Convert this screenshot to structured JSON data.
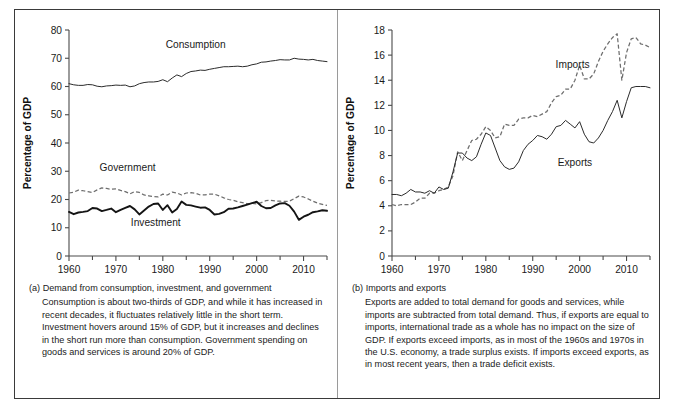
{
  "figure": {
    "panel_a_letter": "(a)",
    "panel_b_letter": "(b)"
  },
  "panel_a": {
    "caption_title": "(a) Demand from consumption, investment, and government",
    "caption_body": "Consumption is about two-thirds of GDP, and while it has increased in recent decades, it fluctuates relatively little in the short term. Investment hovers around 15% of GDP, but it increases and declines in the short run more than consumption. Government spending on goods and services is around 20% of GDP."
  },
  "panel_b": {
    "caption_title": "(b) Imports and exports",
    "caption_body": "Exports are added to total demand for goods and services, while imports are subtracted from total demand. Thus, if exports are equal to imports, international trade as a whole has no impact on the size of GDP. If exports exceed imports, as in most of the 1960s and 1970s in the U.S. economy, a trade surplus exists. If imports exceed exports, as in most recent years, then a trade deficit exists."
  },
  "chart_data": [
    {
      "id": "chart-a",
      "type": "line",
      "title": "",
      "xlabel": "Year",
      "ylabel": "Percentage of GDP",
      "xlim": [
        1960,
        2015
      ],
      "ylim": [
        0,
        80
      ],
      "xticks": [
        1960,
        1970,
        1980,
        1990,
        2000,
        2010
      ],
      "yticks": [
        0,
        10,
        20,
        30,
        40,
        50,
        60,
        70,
        80
      ],
      "grid": false,
      "legend_position": "inline-annotations",
      "annotations": [
        {
          "text": "Consumption",
          "x": 1987,
          "y": 73.5
        },
        {
          "text": "Government",
          "x": 1972.5,
          "y": 30.0
        },
        {
          "text": "Investment",
          "x": 1978.5,
          "y": 10.5
        }
      ],
      "x": [
        1960,
        1961,
        1962,
        1963,
        1964,
        1965,
        1966,
        1967,
        1968,
        1969,
        1970,
        1971,
        1972,
        1973,
        1974,
        1975,
        1976,
        1977,
        1978,
        1979,
        1980,
        1981,
        1982,
        1983,
        1984,
        1985,
        1986,
        1987,
        1988,
        1989,
        1990,
        1991,
        1992,
        1993,
        1994,
        1995,
        1996,
        1997,
        1998,
        1999,
        2000,
        2001,
        2002,
        2003,
        2004,
        2005,
        2006,
        2007,
        2008,
        2009,
        2010,
        2011,
        2012,
        2013,
        2014,
        2015
      ],
      "series": [
        {
          "name": "Consumption",
          "style": "solid-thin",
          "values": [
            61.0,
            60.6,
            60.4,
            60.4,
            60.7,
            60.6,
            60.1,
            59.9,
            60.2,
            60.3,
            60.5,
            60.4,
            60.5,
            59.9,
            60.2,
            61.0,
            61.4,
            61.6,
            61.6,
            61.8,
            62.4,
            61.7,
            63.0,
            64.1,
            63.5,
            64.6,
            65.3,
            65.5,
            65.8,
            65.7,
            66.1,
            66.4,
            66.7,
            67.0,
            67.0,
            67.1,
            67.2,
            67.0,
            67.2,
            67.7,
            68.0,
            68.6,
            68.7,
            69.0,
            69.2,
            69.5,
            69.4,
            69.4,
            70.0,
            69.7,
            69.6,
            69.4,
            69.6,
            69.2,
            69.0,
            68.8
          ]
        },
        {
          "name": "Government",
          "style": "dashed",
          "values": [
            22.3,
            22.6,
            23.3,
            23.1,
            22.8,
            22.5,
            23.4,
            24.1,
            23.9,
            23.6,
            23.8,
            23.2,
            22.8,
            22.0,
            22.8,
            22.5,
            21.6,
            21.3,
            21.0,
            20.9,
            21.9,
            21.6,
            22.6,
            22.3,
            21.6,
            22.3,
            22.4,
            22.2,
            21.6,
            21.6,
            21.9,
            21.9,
            21.3,
            20.6,
            20.0,
            19.7,
            19.2,
            18.9,
            18.5,
            18.6,
            18.4,
            18.9,
            19.6,
            19.7,
            19.5,
            19.4,
            19.3,
            19.4,
            20.3,
            21.2,
            20.9,
            20.2,
            19.4,
            18.7,
            18.3,
            17.9
          ]
        },
        {
          "name": "Investment",
          "style": "solid-thick",
          "values": [
            15.6,
            14.8,
            15.4,
            15.6,
            15.9,
            17.0,
            16.8,
            15.9,
            16.3,
            16.8,
            15.5,
            16.3,
            17.0,
            17.7,
            16.5,
            14.7,
            16.1,
            17.5,
            18.4,
            18.6,
            16.3,
            18.0,
            15.4,
            16.6,
            19.3,
            18.1,
            17.9,
            17.5,
            17.1,
            17.2,
            16.3,
            14.7,
            14.9,
            15.5,
            16.7,
            16.8,
            17.2,
            17.7,
            18.2,
            18.7,
            19.2,
            17.7,
            16.9,
            17.0,
            17.9,
            18.6,
            18.7,
            17.8,
            15.7,
            12.8,
            13.9,
            14.6,
            15.5,
            15.8,
            16.2,
            16.0
          ]
        }
      ]
    },
    {
      "id": "chart-b",
      "type": "line",
      "title": "",
      "xlabel": "Year",
      "ylabel": "Percentage of GDP",
      "xlim": [
        1960,
        2015
      ],
      "ylim": [
        0,
        18
      ],
      "xticks": [
        1960,
        1970,
        1980,
        1990,
        2000,
        2010
      ],
      "yticks": [
        0,
        2,
        4,
        6,
        8,
        10,
        12,
        14,
        16,
        18
      ],
      "grid": false,
      "legend_position": "inline-annotations",
      "annotations": [
        {
          "text": "Imports",
          "x": 1998.5,
          "y": 15.0
        },
        {
          "text": "Exports",
          "x": 1999.0,
          "y": 7.2
        }
      ],
      "x": [
        1960,
        1961,
        1962,
        1963,
        1964,
        1965,
        1966,
        1967,
        1968,
        1969,
        1970,
        1971,
        1972,
        1973,
        1974,
        1975,
        1976,
        1977,
        1978,
        1979,
        1980,
        1981,
        1982,
        1983,
        1984,
        1985,
        1986,
        1987,
        1988,
        1989,
        1990,
        1991,
        1992,
        1993,
        1994,
        1995,
        1996,
        1997,
        1998,
        1999,
        2000,
        2001,
        2002,
        2003,
        2004,
        2005,
        2006,
        2007,
        2008,
        2009,
        2010,
        2011,
        2012,
        2013,
        2014,
        2015
      ],
      "series": [
        {
          "name": "Imports",
          "style": "dashed",
          "values": [
            4.1,
            4.0,
            4.1,
            4.1,
            4.1,
            4.3,
            4.6,
            4.6,
            5.0,
            5.0,
            5.2,
            5.3,
            5.5,
            6.4,
            8.3,
            7.6,
            8.4,
            9.2,
            9.3,
            9.7,
            10.3,
            10.0,
            9.4,
            9.5,
            10.5,
            10.4,
            10.4,
            10.9,
            11.0,
            11.0,
            11.2,
            11.1,
            11.3,
            11.5,
            12.2,
            12.7,
            12.8,
            13.3,
            13.3,
            14.0,
            15.2,
            14.1,
            14.1,
            14.5,
            15.5,
            16.3,
            16.9,
            17.4,
            17.7,
            14.0,
            16.2,
            17.3,
            17.4,
            16.9,
            16.8,
            16.6
          ]
        },
        {
          "name": "Exports",
          "style": "solid-thin",
          "values": [
            4.9,
            4.9,
            4.8,
            5.0,
            5.3,
            5.1,
            5.1,
            5.0,
            5.2,
            5.0,
            5.5,
            5.3,
            5.4,
            6.7,
            8.2,
            8.2,
            7.8,
            7.6,
            7.9,
            8.9,
            9.8,
            9.6,
            8.6,
            7.6,
            7.1,
            6.9,
            7.0,
            7.5,
            8.4,
            8.9,
            9.2,
            9.6,
            9.5,
            9.3,
            9.7,
            10.3,
            10.4,
            10.8,
            10.5,
            10.2,
            10.7,
            9.7,
            9.1,
            9.0,
            9.4,
            10.0,
            10.8,
            11.5,
            12.4,
            11.0,
            12.3,
            13.4,
            13.5,
            13.5,
            13.5,
            13.4
          ]
        }
      ]
    }
  ]
}
